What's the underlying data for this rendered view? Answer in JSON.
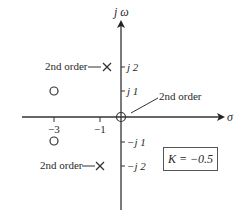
{
  "diagram": {
    "type": "pole-zero-plot",
    "axes": {
      "vertical_label": "jω",
      "horizontal_label": "σ",
      "real_ticks": [
        "−3",
        "−1"
      ],
      "imag_ticks": [
        "j2",
        "j1",
        "−j1",
        "−j2"
      ]
    },
    "poles": [
      {
        "position": "-1+j2",
        "label": "2nd order"
      },
      {
        "position": "-1-j2",
        "label": "2nd order"
      }
    ],
    "zeros": [
      {
        "position": "-3+j1"
      },
      {
        "position": "-3-j1"
      }
    ],
    "origin": {
      "marker": "pole-zero",
      "label": "2nd order"
    },
    "gain_box": {
      "label": "K = −0.5"
    },
    "colors": {
      "line": "#333333",
      "text": "#2a2a2a",
      "background": "#ffffff"
    }
  },
  "labels": {
    "jw": "j ω",
    "sigma": "σ",
    "tick_m3": "−3",
    "tick_m1": "−1",
    "tick_j2": "j 2",
    "tick_j1": "j 1",
    "tick_mj1": "−j 1",
    "tick_mj2": "−j 2",
    "pole_upper_label": "2nd order",
    "pole_lower_label": "2nd order",
    "origin_label": "2nd order",
    "gain": "K = −0.5"
  }
}
